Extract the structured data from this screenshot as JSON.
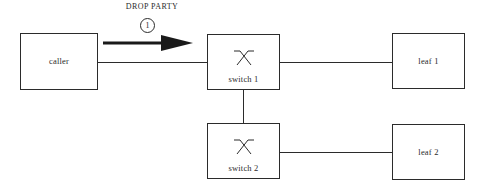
{
  "diagram": {
    "stroke_color": "#2b2b2b",
    "background_color": "#ffffff",
    "annotation": {
      "flow_label": "DROP PARTY",
      "step_number": "1"
    },
    "nodes": [
      {
        "id": "caller",
        "label": "caller",
        "icon": "none"
      },
      {
        "id": "switch1",
        "label": "switch 1",
        "icon": "switch-crossbar-icon"
      },
      {
        "id": "leaf1",
        "label": "leaf 1",
        "icon": "none"
      },
      {
        "id": "switch2",
        "label": "switch 2",
        "icon": "switch-crossbar-icon"
      },
      {
        "id": "leaf2",
        "label": "leaf 2",
        "icon": "none"
      }
    ],
    "links": [
      {
        "from": "caller",
        "to": "switch1",
        "orientation": "horizontal"
      },
      {
        "from": "switch1",
        "to": "leaf1",
        "orientation": "horizontal"
      },
      {
        "from": "switch1",
        "to": "switch2",
        "orientation": "vertical"
      },
      {
        "from": "switch2",
        "to": "leaf2",
        "orientation": "horizontal"
      }
    ]
  }
}
